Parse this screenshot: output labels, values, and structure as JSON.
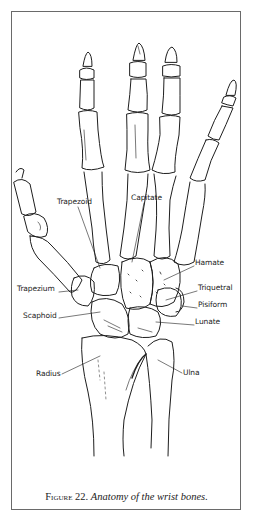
{
  "figure": {
    "number_label": "Figure 22.",
    "title": "Anatomy of the wrist bones."
  },
  "labels": {
    "trapezoid": "Trapezoid",
    "capitate": "Capitate",
    "hamate": "Hamate",
    "triquetral": "Triquetral",
    "pisiform": "Pisiform",
    "lunate": "Lunate",
    "trapezium": "Trapezium",
    "scaphoid": "Scaphoid",
    "radius": "Radius",
    "ulna": "Ulna"
  },
  "colors": {
    "ink": "#1e1e1e",
    "frame": "#6a6a6a",
    "background": "#ffffff"
  }
}
